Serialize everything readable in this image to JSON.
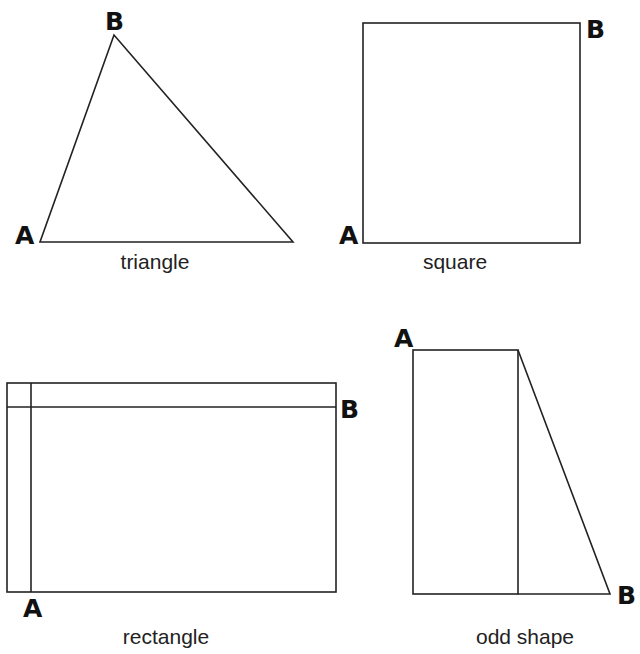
{
  "figures": [
    {
      "id": "triangle",
      "caption": "triangle",
      "point_a": "A",
      "point_b": "B"
    },
    {
      "id": "square",
      "caption": "square",
      "point_a": "A",
      "point_b": "B"
    },
    {
      "id": "rectangle",
      "caption": "rectangle",
      "point_a": "A",
      "point_b": "B"
    },
    {
      "id": "odd-shape",
      "caption": "odd shape",
      "point_a": "A",
      "point_b": "B"
    }
  ],
  "colors": {
    "stroke": "#222222",
    "background": "#ffffff"
  }
}
